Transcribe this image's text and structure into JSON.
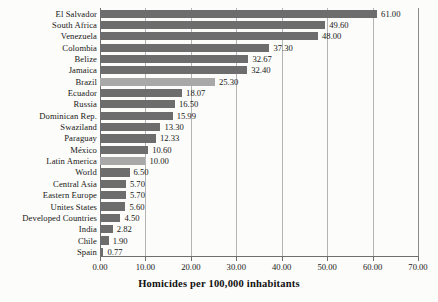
{
  "chart_data": {
    "type": "bar",
    "orientation": "horizontal",
    "title": "",
    "xlabel": "Homicides per 100,000 inhabitants",
    "ylabel": "",
    "xlim": [
      0,
      70
    ],
    "xticks": [
      "0.00",
      "10.00",
      "20.00",
      "30.00",
      "40.00",
      "50.00",
      "60.00",
      "70.00"
    ],
    "xtick_values": [
      0,
      10,
      20,
      30,
      40,
      50,
      60,
      70
    ],
    "grid": true,
    "legend": "none",
    "categories": [
      "El Salvador",
      "South Africa",
      "Venezuela",
      "Colombia",
      "Belize",
      "Jamaica",
      "Brazil",
      "Ecuador",
      "Russia",
      "Dominican Rep.",
      "Swaziland",
      "Paraguay",
      "México",
      "Latin America",
      "World",
      "Central Asia",
      "Eastern Europe",
      "Unites States",
      "Developed Countries",
      "India",
      "Chile",
      "Spain"
    ],
    "values": [
      61.0,
      49.6,
      48.0,
      37.3,
      32.67,
      32.4,
      25.3,
      18.07,
      16.5,
      15.99,
      13.3,
      12.33,
      10.6,
      10.0,
      6.5,
      5.7,
      5.7,
      5.6,
      4.5,
      2.82,
      1.9,
      0.77
    ],
    "value_labels": [
      "61.00",
      "49.60",
      "48.00",
      "37.30",
      "32.67",
      "32.40",
      "25.30",
      "18.07",
      "16.50",
      "15.99",
      "13.30",
      "12.33",
      "10.60",
      "10.00",
      "6.50",
      "5.70",
      "5.70",
      "5.60",
      "4.50",
      "2.82",
      "1.90",
      "0.77"
    ],
    "highlighted": [
      "Brazil",
      "Latin America"
    ],
    "colors": {
      "bar": "#6d6d6d",
      "bar_highlight": "#a8a8a8",
      "grid": "#b4b4b4",
      "axis": "#6f6f6f",
      "text": "#171717",
      "background": "#fcfcfa"
    }
  }
}
